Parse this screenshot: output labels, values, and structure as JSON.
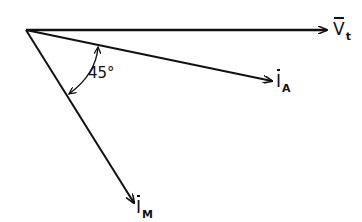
{
  "diagram": {
    "type": "phasor-diagram",
    "vectors": [
      {
        "id": "vt",
        "symbol": "V",
        "subscript": "t",
        "overline": true,
        "direction": "horizontal reference"
      },
      {
        "id": "ia",
        "symbol": "I",
        "subscript": "A",
        "overline": true,
        "direction": "lagging, small angle"
      },
      {
        "id": "im",
        "symbol": "I",
        "subscript": "M",
        "overline": true,
        "direction": "lagging"
      }
    ],
    "angle_annotation": {
      "label": "45°",
      "between": [
        "ia",
        "im"
      ]
    },
    "colors": {
      "ink": "#111111",
      "background": "#ffffff"
    }
  }
}
